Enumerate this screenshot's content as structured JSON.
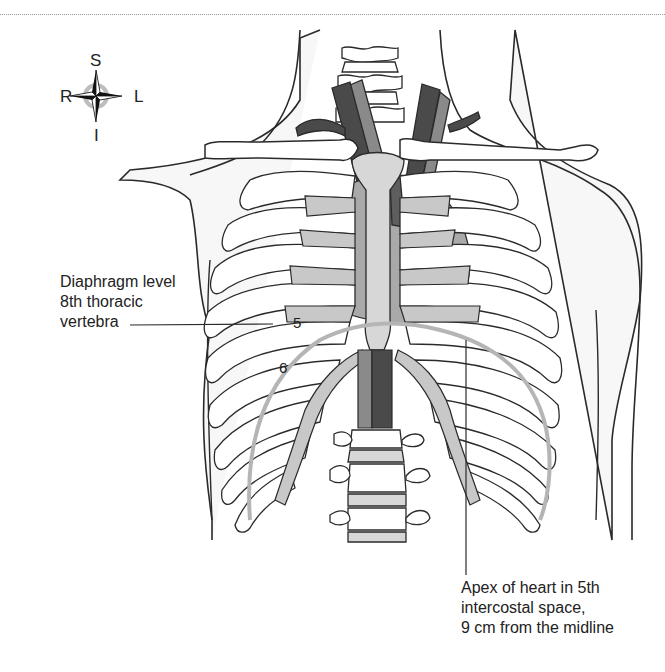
{
  "figure": {
    "compass": {
      "superior": "S",
      "inferior": "I",
      "right": "R",
      "left": "L"
    },
    "labels": {
      "diaphragm": {
        "lines": [
          "Diaphragm level",
          "8th thoracic",
          "vertebra"
        ]
      },
      "apex": {
        "lines": [
          "Apex of heart in 5th",
          "intercostal space,",
          "9 cm from the midline"
        ]
      },
      "rib_numbers": [
        "5",
        "6"
      ]
    },
    "colors": {
      "outline": "#2a2a2a",
      "bone_fill": "#ffffff",
      "cartilage_fill": "#c8c8c8",
      "heart_fill": "#a9a9a9",
      "vessel_dark": "#4a4a4a",
      "vessel_mid": "#8a8a8a",
      "diaphragm_line": "#b5b5b5",
      "skin_bg": "#f6f6f6"
    }
  }
}
